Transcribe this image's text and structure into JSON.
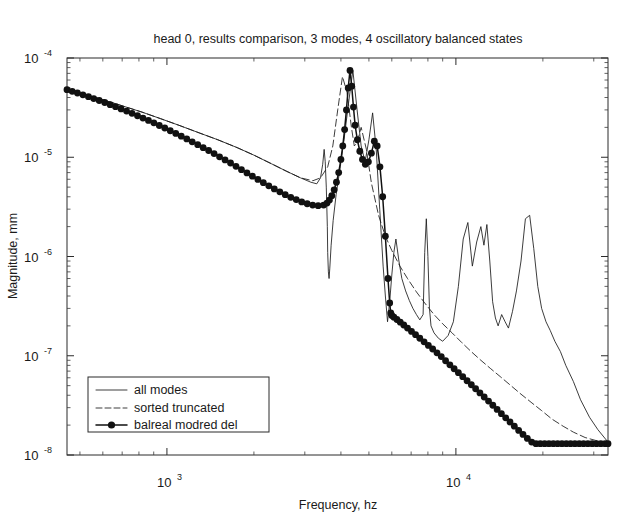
{
  "figure": {
    "background_color": "#ffffff",
    "foreground_color": "#1a1a1a"
  },
  "chart_data": {
    "type": "line",
    "title": "head 0, results comparison, 3 modes, 4 oscillatory balanced states",
    "xlabel": "Frequency, hz",
    "ylabel": "Magnitude, mm",
    "xscale": "log",
    "yscale": "log",
    "xlim": [
      451,
      33600
    ],
    "ylim": [
      1e-08,
      0.0001
    ],
    "grid": false,
    "xtick_labels": [
      "10^3",
      "10^4"
    ],
    "xtick_values": [
      1000,
      10000
    ],
    "ytick_labels": [
      "10^-4",
      "10^-5",
      "10^-6",
      "10^-7",
      "10^-8"
    ],
    "ytick_values": [
      0.0001,
      1e-05,
      1e-06,
      1e-07,
      1e-08
    ],
    "legend_position": "lower left",
    "series": [
      {
        "name": "all modes",
        "style": "thin-solid",
        "color": "#1a1a1a",
        "marker": "none",
        "x": [
          451,
          520,
          600,
          700,
          820,
          950,
          1100,
          1300,
          1500,
          1750,
          2000,
          2300,
          2600,
          2900,
          3150,
          3300,
          3400,
          3460,
          3500,
          3530,
          3560,
          3590,
          3600,
          3620,
          3640,
          3660,
          3700,
          3760,
          3850,
          3980,
          4100,
          4250,
          4400,
          4550,
          4700,
          4850,
          5000,
          5150,
          5300,
          5450,
          5600,
          5700,
          5800,
          5900,
          6000,
          6100,
          6200,
          6350,
          6500,
          6700,
          6900,
          7100,
          7300,
          7500,
          7700,
          7800,
          7900,
          8000,
          8100,
          8200,
          8400,
          8700,
          9000,
          9400,
          9800,
          10200,
          10600,
          11000,
          11400,
          11800,
          12200,
          12500,
          12800,
          13100,
          13400,
          13700,
          14000,
          14400,
          14800,
          15200,
          15700,
          16200,
          16800,
          17400,
          18000,
          18600,
          19200,
          19800,
          20500,
          21200,
          22000,
          23000,
          24000,
          25500,
          27000,
          29000,
          31000,
          33600
        ],
        "y": [
          4.8e-05,
          4.3e-05,
          3.8e-05,
          3.3e-05,
          2.85e-05,
          2.45e-05,
          2.1e-05,
          1.75e-05,
          1.5e-05,
          1.25e-05,
          1.05e-05,
          8.6e-06,
          7.2e-06,
          6.2e-06,
          5.6e-06,
          5.4e-06,
          6.2e-06,
          8.5e-06,
          1.2e-05,
          9e-06,
          5e-06,
          2e-06,
          1.1e-06,
          7e-07,
          6e-07,
          7.5e-07,
          1.3e-06,
          2.3e-06,
          4.2e-06,
          8e-06,
          1.5e-05,
          3.5e-05,
          7.5e-05,
          3e-05,
          1.3e-05,
          9e-06,
          1.5e-05,
          2.8e-05,
          1.2e-05,
          3e-06,
          8e-07,
          4e-07,
          2.2e-07,
          3.5e-07,
          6.5e-07,
          1.1e-06,
          1.5e-06,
          9e-07,
          6e-07,
          4.5e-07,
          3.6e-07,
          3e-07,
          2.6e-07,
          2.3e-07,
          2.6e-07,
          1.1e-06,
          2.4e-06,
          1e-06,
          3e-07,
          2e-07,
          1.7e-07,
          1.5e-07,
          1.4e-07,
          1.6e-07,
          2.2e-07,
          5e-07,
          1.5e-06,
          2.2e-06,
          8e-07,
          1.4e-06,
          2e-06,
          1.3e-06,
          2.1e-06,
          9e-07,
          3.5e-07,
          2.4e-07,
          2e-07,
          2.6e-07,
          2.2e-07,
          1.9e-07,
          2.8e-07,
          4.5e-07,
          9e-07,
          2.4e-06,
          2.6e-06,
          1.2e-06,
          5e-07,
          3e-07,
          2.2e-07,
          1.8e-07,
          1.4e-07,
          1.1e-07,
          8e-08,
          5.5e-08,
          3.6e-08,
          2.4e-08,
          1.8e-08,
          1.35e-08
        ]
      },
      {
        "name": "sorted truncated",
        "style": "dashed",
        "color": "#1a1a1a",
        "marker": "none",
        "x": [
          451,
          520,
          600,
          700,
          820,
          950,
          1100,
          1300,
          1500,
          1750,
          2000,
          2300,
          2600,
          2900,
          3200,
          3400,
          3600,
          3750,
          3900,
          4050,
          4200,
          4350,
          4450,
          4550,
          4700,
          4900,
          5100,
          5400,
          5700,
          6000,
          6400,
          6800,
          7300,
          7800,
          8400,
          9000,
          9700,
          10500,
          11300,
          12200,
          13200,
          14300,
          15500,
          16800,
          18200,
          19800,
          21500,
          23500,
          25500,
          28000,
          30500,
          33600
        ],
        "y": [
          4.8e-05,
          4.3e-05,
          3.8e-05,
          3.3e-05,
          2.85e-05,
          2.45e-05,
          2.1e-05,
          1.75e-05,
          1.5e-05,
          1.25e-05,
          1.05e-05,
          8.6e-06,
          7.2e-06,
          6.2e-06,
          5.8e-06,
          6.2e-06,
          8e-06,
          1.3e-05,
          3e-05,
          6.5e-05,
          4.5e-05,
          2e-05,
          1.3e-05,
          1.4e-05,
          2e-05,
          1.2e-05,
          5.5e-06,
          2.6e-06,
          1.6e-06,
          1.15e-06,
          8e-07,
          6e-07,
          4.4e-07,
          3.4e-07,
          2.6e-07,
          2.1e-07,
          1.7e-07,
          1.35e-07,
          1.1e-07,
          9e-08,
          7.4e-08,
          6.1e-08,
          5e-08,
          4.1e-08,
          3.4e-08,
          2.8e-08,
          2.3e-08,
          1.95e-08,
          1.7e-08,
          1.5e-08,
          1.4e-08,
          1.3e-08
        ]
      },
      {
        "name": "balreal modred del",
        "style": "thick-solid-dots",
        "color": "#111111",
        "marker": "filled-circle",
        "x": [
          451,
          470,
          490,
          512,
          535,
          558,
          583,
          609,
          636,
          664,
          694,
          725,
          757,
          791,
          826,
          863,
          901,
          941,
          983,
          1027,
          1073,
          1121,
          1171,
          1223,
          1278,
          1335,
          1394,
          1456,
          1521,
          1589,
          1660,
          1734,
          1811,
          1892,
          1976,
          2064,
          2156,
          2252,
          2353,
          2458,
          2567,
          2682,
          2802,
          2927,
          3058,
          3194,
          3337,
          3486,
          3580,
          3650,
          3720,
          3790,
          3860,
          3930,
          4000,
          4060,
          4120,
          4180,
          4240,
          4300,
          4360,
          4420,
          4480,
          4560,
          4650,
          4750,
          4860,
          4980,
          5100,
          5220,
          5340,
          5460,
          5580,
          5700,
          5820,
          5900,
          5950,
          6000,
          6100,
          6250,
          6420,
          6600,
          6800,
          7020,
          7250,
          7500,
          7760,
          8030,
          8310,
          8600,
          8900,
          9210,
          9530,
          9860,
          10200,
          10560,
          10930,
          11310,
          11700,
          12110,
          12530,
          12970,
          13420,
          13890,
          14370,
          14870,
          15390,
          15930,
          16490,
          17070,
          17670,
          18290,
          18930,
          19590,
          20280,
          20990,
          21730,
          22490,
          23280,
          24100,
          24940,
          25810,
          26720,
          27650,
          28620,
          29620,
          30660,
          31730,
          32840,
          33600
        ],
        "y": [
          4.8e-05,
          4.62e-05,
          4.44e-05,
          4.26e-05,
          4.08e-05,
          3.9e-05,
          3.73e-05,
          3.56e-05,
          3.39e-05,
          3.23e-05,
          3.07e-05,
          2.92e-05,
          2.77e-05,
          2.62e-05,
          2.48e-05,
          2.35e-05,
          2.22e-05,
          2.09e-05,
          1.97e-05,
          1.85e-05,
          1.74e-05,
          1.63e-05,
          1.53e-05,
          1.43e-05,
          1.34e-05,
          1.25e-05,
          1.17e-05,
          1.09e-05,
          1.01e-05,
          9.4e-06,
          8.75e-06,
          8.1e-06,
          7.5e-06,
          6.95e-06,
          6.45e-06,
          5.98e-06,
          5.55e-06,
          5.15e-06,
          4.8e-06,
          4.48e-06,
          4.2e-06,
          3.95e-06,
          3.75e-06,
          3.55e-06,
          3.4e-06,
          3.3e-06,
          3.25e-06,
          3.3e-06,
          3.45e-06,
          3.7e-06,
          4.1e-06,
          4.7e-06,
          5.6e-06,
          7e-06,
          9.5e-06,
          1.3e-05,
          1.9e-05,
          3e-05,
          5e-05,
          7.5e-05,
          5.2e-05,
          3.2e-05,
          2.1e-05,
          1.5e-05,
          1.15e-05,
          9.5e-06,
          8.5e-06,
          9e-06,
          1.1e-05,
          1.45e-05,
          1.3e-05,
          8e-06,
          4e-06,
          1.6e-06,
          6e-07,
          3.4e-07,
          2.7e-07,
          2.55e-07,
          2.45e-07,
          2.32e-07,
          2.18e-07,
          2.04e-07,
          1.9e-07,
          1.76e-07,
          1.63e-07,
          1.5e-07,
          1.38e-07,
          1.27e-07,
          1.17e-07,
          1.07e-07,
          9.8e-08,
          8.9e-08,
          8.1e-08,
          7.4e-08,
          6.75e-08,
          6.15e-08,
          5.6e-08,
          5.1e-08,
          4.65e-08,
          4.22e-08,
          3.84e-08,
          3.49e-08,
          3.17e-08,
          2.88e-08,
          2.61e-08,
          2.37e-08,
          2.15e-08,
          1.95e-08,
          1.77e-08,
          1.61e-08,
          1.47e-08,
          1.35e-08,
          1.3e-08,
          1.3e-08,
          1.3e-08,
          1.3e-08,
          1.3e-08,
          1.3e-08,
          1.3e-08,
          1.3e-08,
          1.3e-08,
          1.3e-08,
          1.3e-08,
          1.3e-08,
          1.3e-08,
          1.3e-08,
          1.3e-08,
          1.3e-08,
          1.3e-08,
          1.3e-08
        ]
      }
    ],
    "legend_entries": [
      "all modes",
      "sorted truncated",
      "balreal modred del"
    ]
  }
}
